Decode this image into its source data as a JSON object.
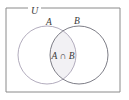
{
  "figure": {
    "type": "venn-diagram",
    "title": "",
    "universe_label": "U",
    "intersection_label": "A ∩ B",
    "sets": [
      {
        "id": "A",
        "label": "A"
      },
      {
        "id": "B",
        "label": "B"
      }
    ],
    "colors": {
      "background": "#ffffff",
      "rectangle_stroke": "#8a8a8a",
      "circle_a_stroke": "#a9a3b5",
      "circle_b_stroke": "#6e6e78",
      "intersection_fill": "#f2f1f4",
      "text": "#3a3a3a"
    },
    "geometry": {
      "rectangle": {
        "x": 6,
        "y": 8,
        "width": 114,
        "height": 84
      },
      "circle_a": {
        "cx": 47,
        "cy": 55,
        "r": 29
      },
      "circle_b": {
        "cx": 79,
        "cy": 55,
        "r": 29
      },
      "universe_label_pos": {
        "x": 32,
        "y": 11
      },
      "label_a_pos": {
        "x": 49,
        "y": 24
      },
      "label_b_pos": {
        "x": 76,
        "y": 23
      },
      "intersection_label_pos": {
        "x": 63,
        "y": 58
      }
    }
  }
}
